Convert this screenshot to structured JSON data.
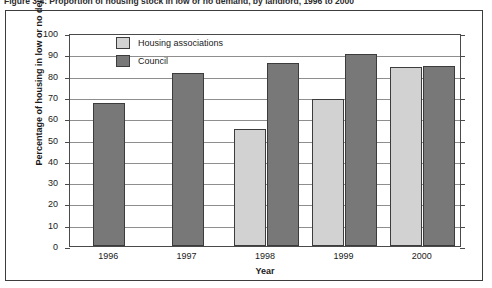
{
  "caption": "Figure 3.4: Proportion of housing stock in low or no demand, by landlord, 1996 to 2000",
  "chart_data": {
    "type": "bar",
    "title": "",
    "xlabel": "Year",
    "ylabel": "Percentage of housing in low or no demand",
    "categories": [
      "1996",
      "1997",
      "1998",
      "1999",
      "2000"
    ],
    "series": [
      {
        "name": "Housing associations",
        "color": "#d2d2d2",
        "values": [
          null,
          null,
          55,
          69,
          84
        ]
      },
      {
        "name": "Council",
        "color": "#787878",
        "values": [
          67,
          81,
          86,
          90,
          84.5
        ]
      }
    ],
    "ylim": [
      0,
      100
    ],
    "ytick_step": 10,
    "yticks": [
      "100",
      "90",
      "80",
      "70",
      "60",
      "50",
      "40",
      "30",
      "20",
      "10",
      "0"
    ],
    "grid": true,
    "legend_position": "top-left-inside"
  }
}
